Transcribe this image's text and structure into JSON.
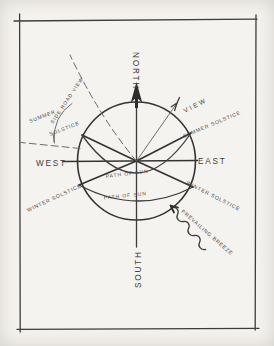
{
  "diagram": {
    "colors": {
      "paper": "#f5f3ef",
      "ink": "#3a3a3a",
      "ink_light": "#6b6b6b"
    },
    "compass": {
      "north": "NORTH",
      "south": "SOUTH",
      "east": "EAST",
      "west": "WEST"
    },
    "sun_path": {
      "upper_label": "PATH OF SUN",
      "lower_label": "PATH OF SUN",
      "summer_left_line1": "SUMMER",
      "summer_left_line2": "SOLSTICE",
      "summer_right": "SUMMER SOLSTICE",
      "winter_left": "WINTER SOLSTICE",
      "winter_right": "WINTER SOLSTICE"
    },
    "annotations": {
      "view": "VIEW",
      "side_road_view": "SIDE ROAD VIEW",
      "prevailing_breeze": "PREVAILING BREEZE"
    }
  }
}
